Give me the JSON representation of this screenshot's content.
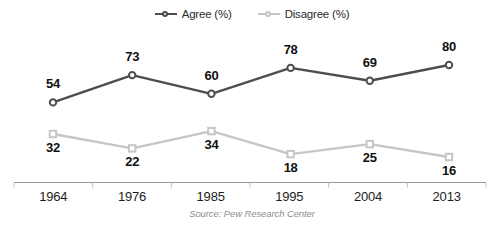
{
  "chart_data": {
    "type": "line",
    "title": "",
    "subtitle": "",
    "xlabel": "",
    "ylabel": "",
    "categories": [
      "1964",
      "1976",
      "1985",
      "1995",
      "2004",
      "2013"
    ],
    "ylim": [
      0,
      100
    ],
    "grid": false,
    "legend_position": "top-center",
    "source": "Source: Pew Research Center",
    "series": [
      {
        "name": "Agree (%)",
        "color": "#4d4d4d",
        "marker": "circle",
        "values": [
          54,
          73,
          60,
          78,
          69,
          80
        ]
      },
      {
        "name": "Disagree (%)",
        "color": "#c6c6c6",
        "marker": "square",
        "values": [
          32,
          22,
          34,
          18,
          25,
          16
        ]
      }
    ]
  },
  "legend": {
    "agree_label": "Agree (%)",
    "disagree_label": "Disagree (%)"
  },
  "axis": {
    "ticks": [
      "1964",
      "1976",
      "1985",
      "1995",
      "2004",
      "2013"
    ],
    "axis_color": "#8e8e8e"
  },
  "labels": {
    "agree": [
      "54",
      "73",
      "60",
      "78",
      "69",
      "80"
    ],
    "disagree": [
      "32",
      "22",
      "34",
      "18",
      "25",
      "16"
    ]
  },
  "footer": {
    "source": "Source: Pew Research Center"
  },
  "colors": {
    "agree": "#4d4d4d",
    "disagree": "#c6c6c6",
    "label": "#111111",
    "source": "#8e8e8e",
    "background": "#ffffff"
  }
}
